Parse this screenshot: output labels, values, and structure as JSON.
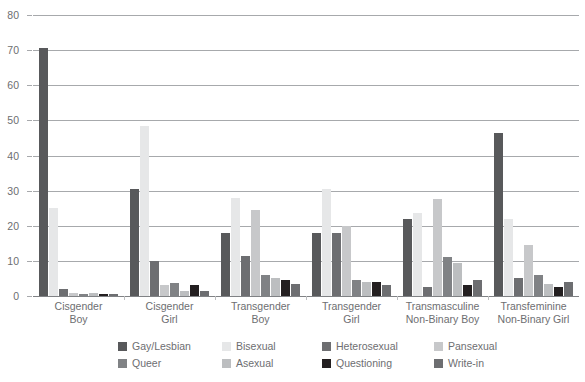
{
  "chart_data": {
    "type": "bar",
    "title": "",
    "subtitle": "",
    "xlabel": "",
    "ylabel": "",
    "ylim": [
      0,
      80
    ],
    "yticks": [
      0,
      10,
      20,
      30,
      40,
      50,
      60,
      70,
      80
    ],
    "grid": true,
    "legend_position": "bottom",
    "categories": [
      "Cisgender Boy",
      "Cisgender Girl",
      "Transgender Boy",
      "Transgender Girl",
      "Transmasculine Non-Binary Boy",
      "Transfeminine Non-Binary Girl"
    ],
    "category_lines": [
      [
        "Cisgender",
        "Boy"
      ],
      [
        "Cisgender",
        "Girl"
      ],
      [
        "Transgender",
        "Boy"
      ],
      [
        "Transgender",
        "Girl"
      ],
      [
        "Transmasculine",
        "Non-Binary Boy"
      ],
      [
        "Transfeminine",
        "Non-Binary Girl"
      ]
    ],
    "series": [
      {
        "name": "Gay/Lesbian",
        "color": "#58595b",
        "values": [
          70.5,
          30.5,
          18.0,
          18.0,
          22.0,
          46.5
        ]
      },
      {
        "name": "Bisexual",
        "color": "#e6e7e8",
        "values": [
          25.0,
          48.5,
          28.0,
          30.5,
          23.5,
          22.0
        ]
      },
      {
        "name": "Heterosexual",
        "color": "#6d6e71",
        "values": [
          2.0,
          10.0,
          11.5,
          18.0,
          2.5,
          5.0
        ]
      },
      {
        "name": "Pansexual",
        "color": "#c7c8ca",
        "values": [
          0.8,
          3.0,
          24.5,
          20.0,
          27.5,
          14.5
        ]
      },
      {
        "name": "Queer",
        "color": "#808285",
        "values": [
          0.5,
          3.8,
          6.0,
          4.5,
          11.0,
          6.0
        ]
      },
      {
        "name": "Asexual",
        "color": "#bcbec0",
        "values": [
          0.8,
          1.5,
          5.0,
          4.0,
          9.5,
          3.5
        ]
      },
      {
        "name": "Questioning",
        "color": "#231f20",
        "values": [
          0.7,
          3.0,
          4.5,
          4.0,
          3.0,
          2.5
        ]
      },
      {
        "name": "Write-in",
        "color": "#6d6e71",
        "values": [
          0.5,
          1.5,
          3.5,
          3.0,
          4.5,
          4.0
        ]
      }
    ]
  },
  "axis": {
    "y_tick_labels": [
      "0",
      "10",
      "20",
      "30",
      "40",
      "50",
      "60",
      "70",
      "80"
    ]
  },
  "legend": {
    "rows": [
      [
        "Gay/Lesbian",
        "Bisexual",
        "Heterosexual",
        "Pansexual"
      ],
      [
        "Queer",
        "Asexual",
        "Questioning",
        "Write-in"
      ]
    ]
  },
  "colors": {
    "gridline": "#a7a9ac",
    "baseline": "#808285",
    "text": "#6d6e71",
    "background": "#ffffff"
  }
}
